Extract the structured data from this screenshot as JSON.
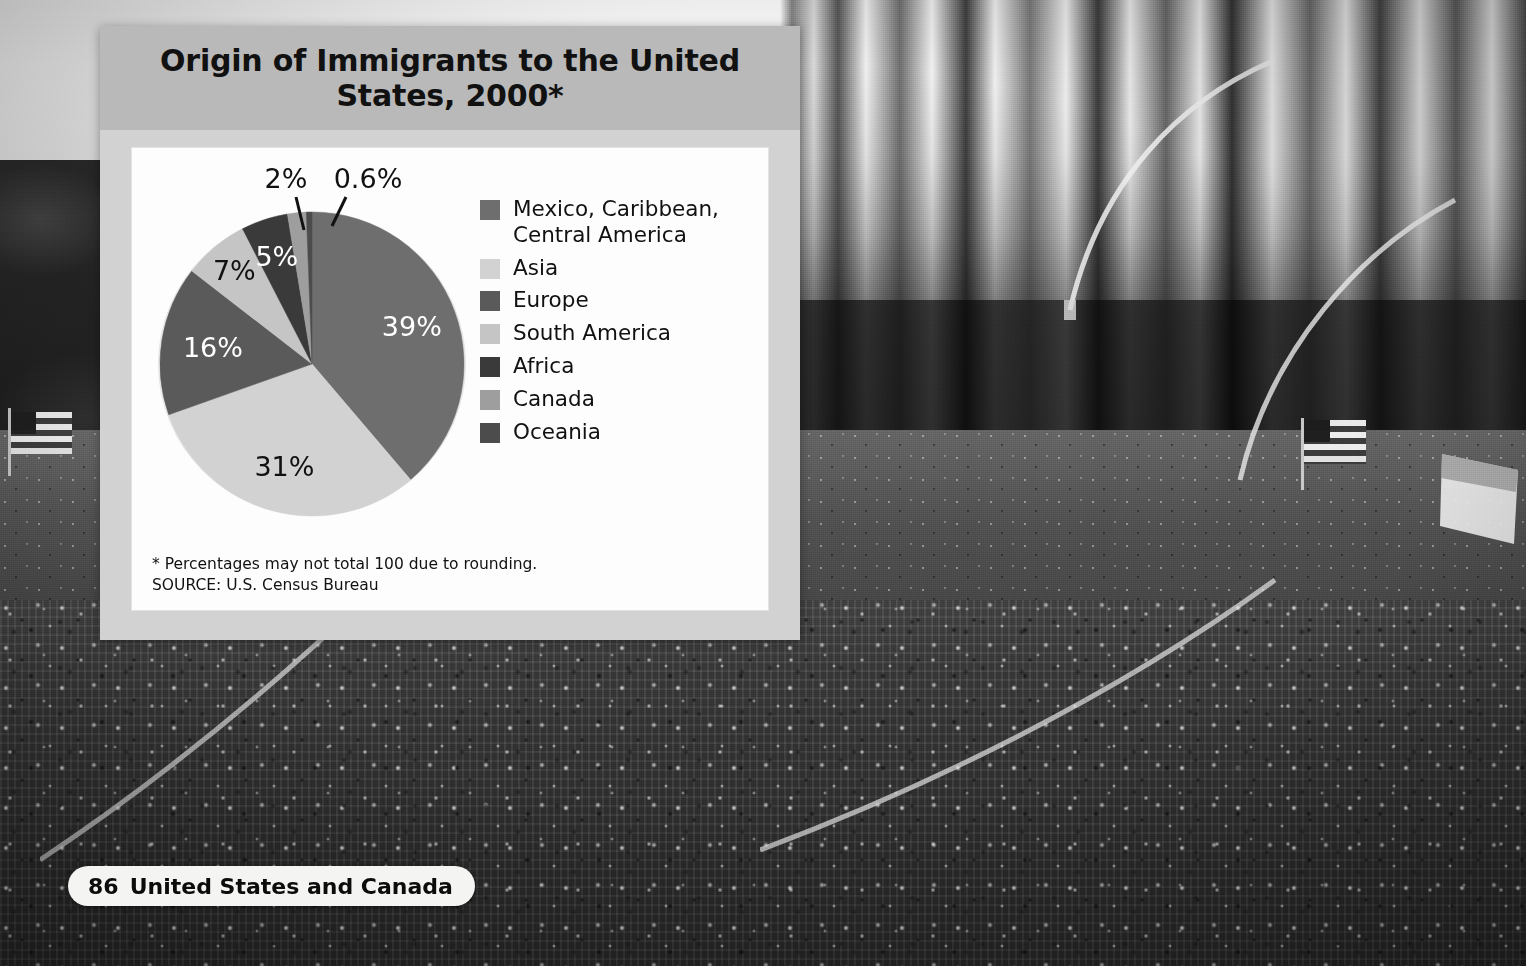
{
  "panel": {
    "title": "Origin of Immigrants to the United States, 2000*",
    "note_line1": "* Percentages may not total 100 due to rounding.",
    "note_line2": "SOURCE: U.S. Census Bureau"
  },
  "footer": {
    "page_number": "86",
    "section": "United States and Canada"
  },
  "chart_data": {
    "type": "pie",
    "title": "Origin of Immigrants to the United States, 2000*",
    "subtitle": "",
    "xlabel": "",
    "ylabel": "",
    "legend_position": "right",
    "grid": false,
    "units": "percent",
    "note": "* Percentages may not total 100 due to rounding.",
    "source": "SOURCE: U.S. Census Bureau",
    "start_angle_deg": 0,
    "direction": "clockwise",
    "categories": [
      "Mexico, Caribbean, Central America",
      "Asia",
      "Europe",
      "South America",
      "Africa",
      "Canada",
      "Oceania"
    ],
    "values": [
      39,
      31,
      16,
      7,
      5,
      2,
      0.6
    ],
    "labels": [
      "39%",
      "31%",
      "16%",
      "7%",
      "5%",
      "2%",
      "0.6%"
    ],
    "colors": [
      "#6e6e6e",
      "#d2d2d2",
      "#5a5a5a",
      "#c5c5c5",
      "#3a3a3a",
      "#9e9e9e",
      "#4c4c4c"
    ],
    "label_colors": [
      "#ffffff",
      "#111111",
      "#ffffff",
      "#111111",
      "#ffffff",
      "#111111",
      "#111111"
    ],
    "slices": [
      {
        "name": "Mexico, Caribbean, Central America",
        "value": 39,
        "label": "39%",
        "color": "#6e6e6e"
      },
      {
        "name": "Asia",
        "value": 31,
        "label": "31%",
        "color": "#d2d2d2"
      },
      {
        "name": "Europe",
        "value": 16,
        "label": "16%",
        "color": "#5a5a5a"
      },
      {
        "name": "South America",
        "value": 7,
        "label": "7%",
        "color": "#c5c5c5"
      },
      {
        "name": "Africa",
        "value": 5,
        "label": "5%",
        "color": "#3a3a3a"
      },
      {
        "name": "Canada",
        "value": 2,
        "label": "2%",
        "color": "#9e9e9e"
      },
      {
        "name": "Oceania",
        "value": 0.6,
        "label": "0.6%",
        "color": "#4c4c4c"
      }
    ]
  },
  "legend": {
    "items": [
      {
        "label": "Mexico, Caribbean,\nCentral America",
        "color": "#6e6e6e"
      },
      {
        "label": "Asia",
        "color": "#d2d2d2"
      },
      {
        "label": "Europe",
        "color": "#5a5a5a"
      },
      {
        "label": "South America",
        "color": "#c5c5c5"
      },
      {
        "label": "Africa",
        "color": "#3a3a3a"
      },
      {
        "label": "Canada",
        "color": "#9e9e9e"
      },
      {
        "label": "Oceania",
        "color": "#4c4c4c"
      }
    ]
  },
  "colors": {
    "panel_body": "#d2d2d2",
    "panel_header": "#b9b9b9",
    "chart_background": "#fdfdfd",
    "footer_pill": "#f4f4f2"
  }
}
